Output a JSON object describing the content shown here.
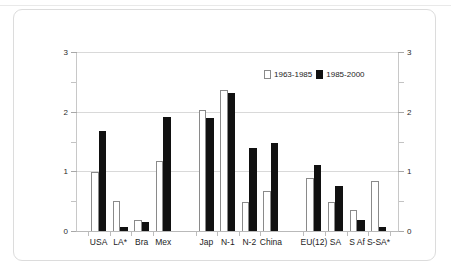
{
  "figure": {
    "background_color": "#ffffff",
    "card_border_color": "#dcdcdc"
  },
  "legend": {
    "position": "top-right-inside",
    "entries": [
      {
        "label": "1963-1985",
        "swatch": "hollow-white-bar-swatch",
        "color": "#ffffff"
      },
      {
        "label": "1985-2000",
        "swatch": "solid-black-bar-swatch",
        "color": "#111111"
      }
    ]
  },
  "axes": {
    "left_ticks": [
      "0",
      "1",
      "2",
      "3"
    ],
    "right_ticks": [
      "0",
      "1",
      "2",
      "3"
    ]
  },
  "chart_data": {
    "type": "bar",
    "title": "",
    "subtitle": "",
    "xlabel": "",
    "ylabel": "",
    "ylim": [
      0,
      3
    ],
    "yticks": [
      0,
      1,
      2,
      3
    ],
    "y_minor_ticks": [
      0.5,
      1.5,
      2.5
    ],
    "grid": true,
    "grid_axis": "y",
    "legend_position": "upper right",
    "dual_y_axis": true,
    "categories": [
      "USA",
      "LA*",
      "Bra",
      "Mex",
      "Jap",
      "N-1",
      "N-2",
      "China",
      "EU(12)",
      "SA",
      "S Af",
      "S-SA*"
    ],
    "group_breaks_after": [
      "Mex",
      "China"
    ],
    "series": [
      {
        "name": "1963-1985",
        "color": "#ffffff",
        "edgecolor": "#8a8a8a",
        "values": [
          1.0,
          0.52,
          0.2,
          1.19,
          2.04,
          2.38,
          0.5,
          0.68,
          0.91,
          0.5,
          0.37,
          0.85
        ]
      },
      {
        "name": "1985-2000",
        "color": "#111111",
        "edgecolor": "#111111",
        "values": [
          1.7,
          0.08,
          0.17,
          1.92,
          1.91,
          2.33,
          1.41,
          1.5,
          1.12,
          0.77,
          0.2,
          0.08
        ]
      }
    ]
  }
}
